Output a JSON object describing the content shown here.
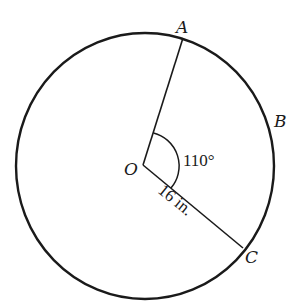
{
  "diagram": {
    "points": {
      "center": "O",
      "a": "A",
      "b": "B",
      "c": "C"
    },
    "angle_label": "110°",
    "angle_degrees": 110,
    "radius_label": "16 in.",
    "radius_value": 16,
    "radius_unit": "in.",
    "colors": {
      "stroke": "#1a1a1a",
      "background": "#ffffff"
    }
  }
}
